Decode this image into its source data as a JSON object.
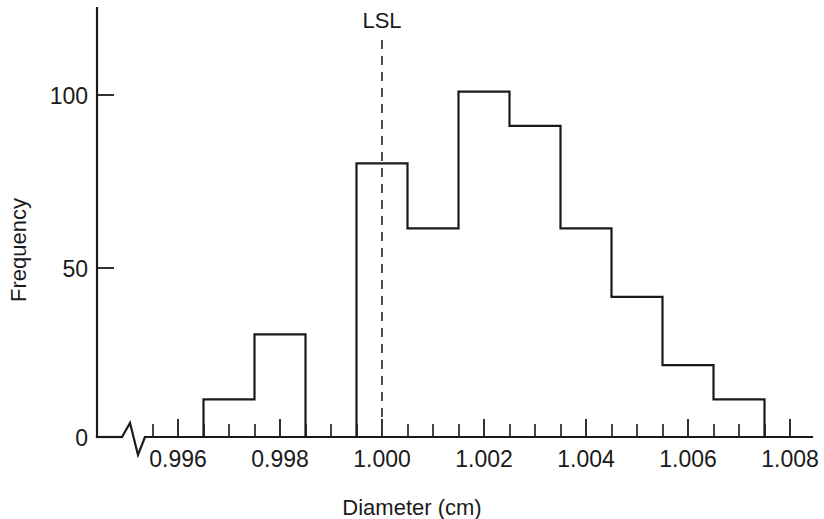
{
  "chart_data": {
    "type": "bar",
    "title": "",
    "subtitle": "",
    "xlabel": "Diameter (cm)",
    "ylabel": "Frequency",
    "categories": [
      "0.9965",
      "0.9975",
      "0.9985",
      "0.9995",
      "1.0005",
      "1.0015",
      "1.0025",
      "1.0035",
      "1.0045",
      "1.0055"
    ],
    "bin_edges": [
      0.996,
      0.997,
      0.998,
      0.999,
      1.0,
      1.001,
      1.002,
      1.003,
      1.004,
      1.005,
      1.006
    ],
    "values": [
      11,
      30,
      80,
      61,
      101,
      91,
      61,
      41,
      21,
      11
    ],
    "bars": [
      {
        "left": 0.9965,
        "right": 0.9975,
        "value": 11
      },
      {
        "left": 0.9975,
        "right": 0.9985,
        "value": 30
      },
      {
        "left": 0.9995,
        "right": 1.0005,
        "value": 80
      },
      {
        "left": 1.0005,
        "right": 1.0015,
        "value": 61
      },
      {
        "left": 1.0015,
        "right": 1.0025,
        "value": 101
      },
      {
        "left": 1.0025,
        "right": 1.0035,
        "value": 91
      },
      {
        "left": 1.0035,
        "right": 1.0045,
        "value": 61
      },
      {
        "left": 1.0045,
        "right": 1.0055,
        "value": 41
      },
      {
        "left": 1.0055,
        "right": 1.0065,
        "value": 21
      },
      {
        "left": 1.0065,
        "right": 1.0075,
        "value": 11
      }
    ],
    "xlim": [
      0.9955,
      1.0085
    ],
    "ylim": [
      0,
      120
    ],
    "x_tick_labels": [
      "0.996",
      "0.998",
      "1.000",
      "1.002",
      "1.004",
      "1.006",
      "1.008"
    ],
    "x_tick_values": [
      0.996,
      0.998,
      1.0,
      1.002,
      1.004,
      1.006,
      1.008
    ],
    "x_minor_interval": 0.0005,
    "y_tick_labels": [
      "0",
      "50",
      "100"
    ],
    "y_tick_values": [
      0,
      50,
      100
    ],
    "grid": false,
    "legend": false,
    "axis_break": true,
    "annotations": [
      {
        "label": "LSL",
        "type": "vertical-dashed-line",
        "x": 1.0
      }
    ]
  },
  "labels": {
    "y_axis_title": "Frequency",
    "x_axis_title": "Diameter (cm)",
    "lsl": "LSL",
    "y0": "0",
    "y50": "50",
    "y100": "100",
    "x996": "0.996",
    "x998": "0.998",
    "x1000": "1.000",
    "x1002": "1.002",
    "x1004": "1.004",
    "x1006": "1.006",
    "x1008": "1.008"
  },
  "colors": {
    "ink": "#1a1a1a",
    "dash": "#3a3a3a",
    "background": "#ffffff"
  }
}
